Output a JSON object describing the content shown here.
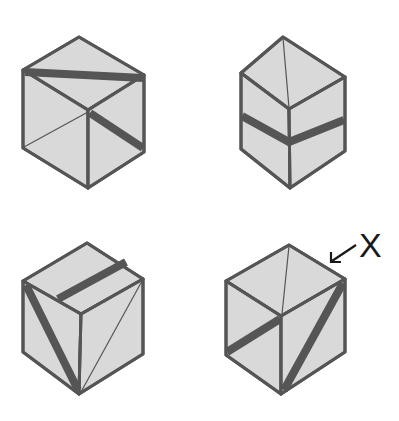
{
  "figure": {
    "colors": {
      "face": "#d9d9d9",
      "stroke": "#555555",
      "label": "#1a1a1a",
      "background": "#ffffff"
    },
    "cubes": [
      {
        "id": "cube-top-left",
        "position": "top-left"
      },
      {
        "id": "cube-top-right",
        "position": "top-right"
      },
      {
        "id": "cube-bottom-left",
        "position": "bottom-left"
      },
      {
        "id": "cube-bottom-right",
        "position": "bottom-right",
        "annotated": true
      }
    ],
    "annotation": {
      "label": "X",
      "points_to": "top-right edge of bottom-right cube"
    }
  }
}
